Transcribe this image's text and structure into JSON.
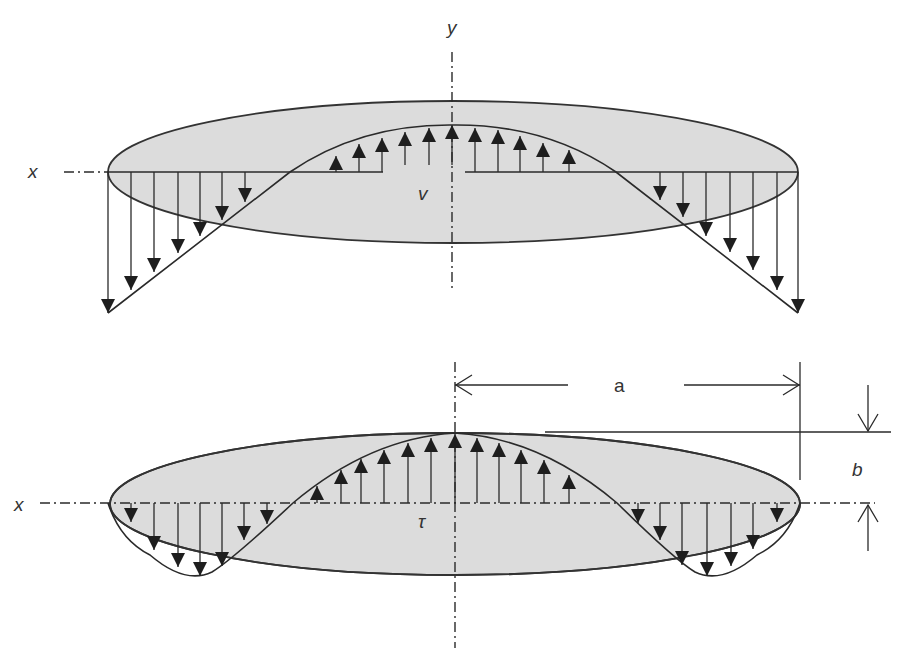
{
  "figure": {
    "colors": {
      "section_fill": "#dcdcdc",
      "line": "#2a2a2a",
      "arrow_head": "#1e1e1e",
      "background": "#ffffff"
    },
    "top_panel": {
      "axis_x_label": "x",
      "axis_y_label": "y",
      "stress_label": "v",
      "ellipse": {
        "cx": 453,
        "cy": 172,
        "rx": 345,
        "ry": 71
      },
      "arrows_up_count": 11,
      "arrows_down_left_count": 8,
      "arrows_down_right_count": 8
    },
    "bottom_panel": {
      "axis_x_label": "x",
      "stress_label": "τ",
      "ellipse": {
        "cx": 455,
        "cy": 504,
        "rx": 345,
        "ry": 71
      },
      "arrows_up_count": 13,
      "arrows_down_left_count": 8,
      "arrows_down_right_count": 8,
      "dimensions": {
        "half_width_label": "a",
        "half_height_label": "b"
      }
    }
  }
}
